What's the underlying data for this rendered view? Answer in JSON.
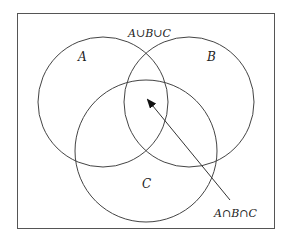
{
  "diagram": {
    "type": "venn",
    "universe_label": "A∪B∪C",
    "sets": [
      {
        "name": "A",
        "label": "A",
        "cx": 103,
        "cy": 102,
        "r": 65
      },
      {
        "name": "B",
        "label": "B",
        "cx": 189,
        "cy": 102,
        "r": 65
      },
      {
        "name": "C",
        "label": "C",
        "cx": 146,
        "cy": 151,
        "r": 71
      }
    ],
    "annotation": {
      "label": "A∩B∩C",
      "points_to": "triple intersection"
    },
    "colors": {
      "stroke": "#444444",
      "background": "#ffffff"
    }
  }
}
